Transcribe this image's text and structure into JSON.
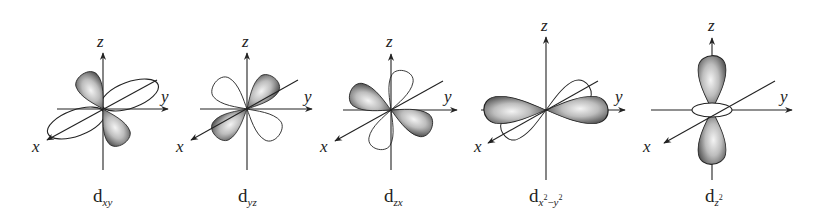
{
  "figure": {
    "fill_colors": {
      "shaded_dark": "#4a4a4a",
      "shaded_light": "#f2f2f2",
      "stroke": "#222222",
      "unshaded": "#ffffff"
    }
  },
  "axes_labels": {
    "x": "x",
    "y": "y",
    "z": "z"
  },
  "orbitals": [
    {
      "id": "dxy",
      "base": "d",
      "subscript": "xy",
      "superscript_parts": []
    },
    {
      "id": "dyz",
      "base": "d",
      "subscript": "yz",
      "superscript_parts": []
    },
    {
      "id": "dzx",
      "base": "d",
      "subscript": "zx",
      "superscript_parts": []
    },
    {
      "id": "dx2-y2",
      "base": "d",
      "subscript_a": "x",
      "sup_a": "2",
      "minus": "−",
      "subscript_b": "y",
      "sup_b": "2"
    },
    {
      "id": "dz2",
      "base": "d",
      "subscript": "z",
      "sup": "2"
    }
  ]
}
